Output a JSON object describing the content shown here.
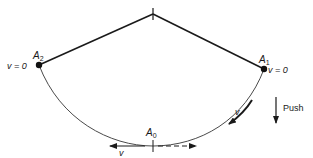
{
  "diagram": {
    "type": "pendulum-motion",
    "colors": {
      "line": "#1a1a1a",
      "arc": "#4a4a4a",
      "background": "#ffffff"
    },
    "pivot": {
      "x": 153,
      "y": 14
    },
    "points": {
      "A2": {
        "label": "A",
        "subscript": "2",
        "x": 39,
        "y": 65,
        "velocity_label": "v = 0"
      },
      "A1": {
        "label": "A",
        "subscript": "1",
        "x": 264,
        "y": 69,
        "velocity_label": "v = 0"
      },
      "A0": {
        "label": "A",
        "subscript": "0",
        "x": 153,
        "y": 146
      }
    },
    "arrows": {
      "v_left": {
        "label": "v",
        "direction": "left",
        "style": "solid"
      },
      "right_dashed": {
        "direction": "right",
        "style": "dashed"
      },
      "v_tangent": {
        "label": "v",
        "direction": "down-along-arc"
      },
      "push": {
        "label": "Push",
        "direction": "down"
      }
    }
  }
}
